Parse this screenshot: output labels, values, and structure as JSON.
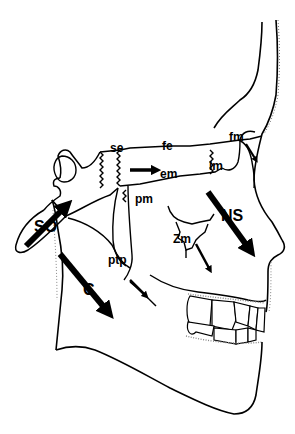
{
  "diagram": {
    "labels": {
      "se": "se",
      "fe": "fe",
      "em": "em",
      "lm": "lm",
      "fm": "fm",
      "pm": "pm",
      "ns": "NS",
      "zm": "Zm",
      "so": "SO",
      "ptp": "ptp",
      "c": "C"
    },
    "arrows": [
      {
        "id": "so-arrow",
        "label": "SO",
        "direction": "up-right"
      },
      {
        "id": "c-arrow",
        "label": "C",
        "direction": "down-right"
      },
      {
        "id": "se-em-arrow",
        "direction": "right"
      },
      {
        "id": "ns-arrow",
        "label": "NS",
        "direction": "down-right"
      },
      {
        "id": "zm-arrow",
        "label": "Zm",
        "direction": "down-right"
      },
      {
        "id": "fm-arrow",
        "label": "fm",
        "direction": "down-right"
      },
      {
        "id": "ptp-arrow",
        "label": "ptp",
        "direction": "down-right"
      }
    ],
    "colors": {
      "line": "#000000",
      "background": "#ffffff",
      "stipple": "#888888"
    }
  }
}
